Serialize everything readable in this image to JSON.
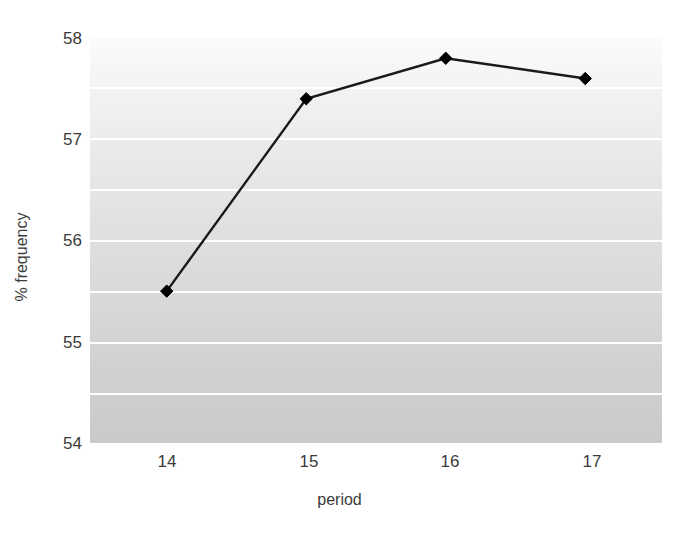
{
  "chart_data": {
    "type": "line",
    "title": "",
    "subtitle": "",
    "xlabel": "period",
    "ylabel": "% frequency",
    "x": [
      14,
      15,
      16,
      17
    ],
    "categories": [
      "14",
      "15",
      "16",
      "17"
    ],
    "values": [
      55.5,
      57.4,
      57.8,
      57.6
    ],
    "series": [
      {
        "name": "% frequency",
        "values": [
          55.5,
          57.4,
          57.8,
          57.6
        ],
        "marker": "diamond",
        "marker_color": "#000000",
        "line_color": "#1a1a1a"
      }
    ],
    "xlim": [
      13.45,
      17.55
    ],
    "ylim": [
      54,
      58
    ],
    "xticks": [
      "14",
      "15",
      "16",
      "17"
    ],
    "yticks": [
      "58",
      "57",
      "56",
      "55",
      "54"
    ],
    "ytick_values": [
      58,
      57,
      56,
      55,
      54
    ],
    "grid": true,
    "grid_interval": 0.5,
    "grid_color": "#ffffff",
    "gridline_values": [
      57.5,
      57.0,
      56.5,
      56.0,
      55.5,
      55.0,
      54.5
    ],
    "legend": false,
    "legend_position": "none",
    "plot_background": "gradient-light-gray-to-gray",
    "figure_background": "#ffffff",
    "annotations": []
  }
}
